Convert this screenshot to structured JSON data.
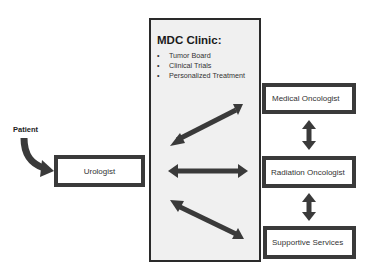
{
  "diagram": {
    "patient_label": "Patient",
    "center": {
      "title": "MDC Clinic:",
      "items": [
        "Tumor Board",
        "Clinical Trials",
        "Personalized Treatment"
      ]
    },
    "nodes": {
      "urologist": "Urologist",
      "medical_oncologist": "Medical Oncologist",
      "radiation_oncologist": "Radiation Oncologist",
      "supportive_services": "Supportive Services"
    },
    "edges": [
      {
        "from": "patient",
        "to": "urologist",
        "type": "curved-arrow"
      },
      {
        "from": "mdc_clinic",
        "to": "medical_oncologist",
        "type": "bidirectional"
      },
      {
        "from": "mdc_clinic",
        "to": "radiation_oncologist",
        "type": "bidirectional"
      },
      {
        "from": "mdc_clinic",
        "to": "supportive_services",
        "type": "bidirectional"
      },
      {
        "from": "medical_oncologist",
        "to": "radiation_oncologist",
        "type": "bidirectional"
      },
      {
        "from": "radiation_oncologist",
        "to": "supportive_services",
        "type": "bidirectional"
      }
    ],
    "colors": {
      "arrow": "#3a3a3a",
      "box_border": "#3a3a3a",
      "center_fill": "#f0f0f0"
    }
  }
}
